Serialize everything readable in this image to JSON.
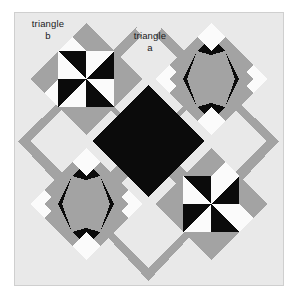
{
  "figure": {
    "kind": "quilt-block-diagram",
    "setting": "on-point",
    "width": 297,
    "height": 299
  },
  "panel": {
    "x": 14,
    "y": 12,
    "width": 269,
    "height": 273,
    "background_color": "#e9e9e9",
    "border_color": "#cfcfcf",
    "outer_margin_color": "#ffffff"
  },
  "palette": {
    "black": "#0b0b0b",
    "gray": "#a3a3a3",
    "gray_light": "#b5b5b5",
    "white": "#fbfbfb",
    "background": "#e9e9e9",
    "panel_border": "#cfcfcf",
    "label_text": "#1a1a1a"
  },
  "labels": [
    {
      "id": "triangle-b",
      "line1": "triangle",
      "line2": "b",
      "x": 48,
      "y": 24
    },
    {
      "id": "triangle-a",
      "line1": "triangle",
      "line2": "a",
      "x": 150,
      "y": 36
    }
  ],
  "center": {
    "name": "center-black-diamond",
    "fill": "#0b0b0b",
    "cx": 148.5,
    "cy": 141,
    "half_diagonal": 56
  },
  "blocks": [
    {
      "id": "block-top-left",
      "type": "pinwheel",
      "cx": 86,
      "cy": 79,
      "half_diagonal": 56,
      "rotation": 0
    },
    {
      "id": "block-top-right",
      "type": "star",
      "cx": 211,
      "cy": 79,
      "half_diagonal": 56,
      "rotation": 0
    },
    {
      "id": "block-bottom-left",
      "type": "star",
      "cx": 86,
      "cy": 204,
      "half_diagonal": 56,
      "rotation": 0
    },
    {
      "id": "block-bottom-right",
      "type": "pinwheel",
      "cx": 211,
      "cy": 204,
      "half_diagonal": 56,
      "rotation": 0
    }
  ],
  "sashing": {
    "fill": "#a3a3a3",
    "description": "gray diagonal sashing strips framing the on-point blocks"
  },
  "counts": {
    "pinwheel_blocks": 2,
    "star_blocks": 2,
    "center_blocks": 1,
    "total_blocks": 5
  }
}
